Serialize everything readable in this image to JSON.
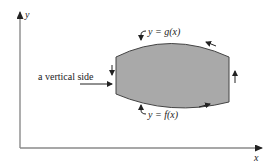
{
  "axes": {
    "x_label": "x",
    "y_label": "y",
    "axis_color": "#8a8a8a"
  },
  "region": {
    "fill_color": "#a9a9a9",
    "edge_color": "#444444",
    "upper_curve_label": "y = g(x)",
    "lower_curve_label": "y = f(x)"
  },
  "annotations": {
    "vertical_side_label": "a vertical side"
  }
}
